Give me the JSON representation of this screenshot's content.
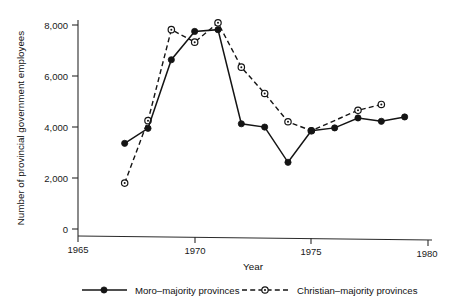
{
  "chart_data": {
    "type": "line",
    "title": "",
    "xlabel": "Year",
    "ylabel": "Number of provincial government employees",
    "xlim": [
      1965,
      1980
    ],
    "ylim": [
      0,
      8600
    ],
    "grid": false,
    "legend_position": "bottom",
    "xticks": [
      1965,
      1970,
      1975,
      1980
    ],
    "xtick_labels": [
      "1965",
      "1970",
      "1975",
      "1980"
    ],
    "yticks": [
      0,
      2000,
      4000,
      6000,
      8000
    ],
    "ytick_labels": [
      "0",
      "2,000",
      "4,000",
      "6,000",
      "8,000"
    ],
    "series": [
      {
        "name": "Moro–majority provinces",
        "style": "solid",
        "marker": "filled-circle",
        "color": "#141414",
        "x": [
          1967,
          1968,
          1969,
          1970,
          1971,
          1972,
          1973,
          1974,
          1975,
          1976,
          1977,
          1978,
          1979
        ],
        "values": [
          3380,
          3980,
          6680,
          7800,
          7880,
          4200,
          4080,
          2710,
          3960,
          4080,
          4480,
          4360,
          4540
        ]
      },
      {
        "name": "Christian–majority provinces",
        "style": "dashed",
        "marker": "open-circle",
        "color": "#141414",
        "x": [
          1967,
          1968,
          1969,
          1970,
          1971,
          1972,
          1973,
          1974,
          1975,
          1977,
          1978
        ],
        "values": [
          1820,
          4280,
          7860,
          7380,
          8150,
          6420,
          5400,
          4300,
          3960,
          4780,
          5020
        ]
      }
    ]
  },
  "legend": {
    "entries": [
      {
        "label": "Moro–majority provinces",
        "style": "solid",
        "marker": "filled-circle"
      },
      {
        "label": "Christian–majority provinces",
        "style": "dashed",
        "marker": "open-circle"
      }
    ]
  }
}
